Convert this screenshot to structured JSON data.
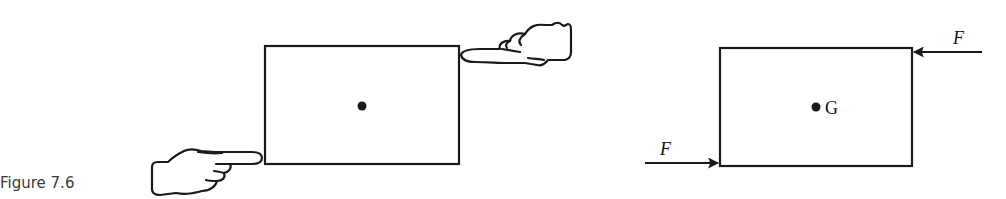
{
  "figure": {
    "caption": "Figure 7.6"
  },
  "left_diagram": {
    "description": "Rectangle pushed by two hands at opposite corners",
    "rectangle": {
      "x": 265,
      "y": 46,
      "width": 194,
      "height": 118
    },
    "center_dot": {
      "x": 362,
      "y": 106
    }
  },
  "right_diagram": {
    "description": "Free body diagram: couple of forces F on rectangle",
    "rectangle": {
      "x": 720,
      "y": 48,
      "width": 192,
      "height": 118
    },
    "center_label": "G",
    "force_top": {
      "label": "F",
      "direction": "left"
    },
    "force_bottom": {
      "label": "F",
      "direction": "right"
    }
  },
  "colors": {
    "stroke": "#1a1a1a",
    "background": "#ffffff"
  }
}
